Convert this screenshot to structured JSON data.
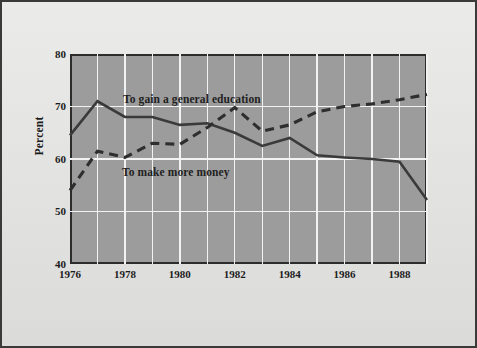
{
  "chart_data": {
    "type": "line",
    "title": "",
    "subtitle": "",
    "xlabel": "",
    "ylabel": "Percent",
    "xlim": [
      1976,
      1989
    ],
    "ylim": [
      40,
      80
    ],
    "yticks": [
      40,
      50,
      60,
      70,
      80
    ],
    "ytick_labels": [
      "40",
      "50",
      "60",
      "70",
      "80"
    ],
    "xticks": [
      1976,
      1978,
      1980,
      1982,
      1984,
      1986,
      1988
    ],
    "xtick_labels": [
      "1976",
      "1978",
      "1980",
      "1982",
      "1984",
      "1986",
      "1988"
    ],
    "grid": true,
    "grid_color": "#f2f2f2",
    "plot_background": "#9c9c9c",
    "figure_background": "#e2e2e0",
    "legend_position": "inline-annotation",
    "x": [
      1976,
      1977,
      1978,
      1979,
      1980,
      1981,
      1982,
      1983,
      1984,
      1985,
      1986,
      1987,
      1988,
      1989
    ],
    "series": [
      {
        "name": "To gain a general education",
        "style": "solid",
        "color": "#3a3a3a",
        "values": [
          64.5,
          71.0,
          68.0,
          68.0,
          66.5,
          66.8,
          65.0,
          62.5,
          64.0,
          60.7,
          60.3,
          60.0,
          59.5,
          52.2
        ]
      },
      {
        "name": "To make more money",
        "style": "dashed",
        "color": "#2e2e2e",
        "values": [
          54.0,
          61.5,
          60.3,
          63.0,
          62.8,
          66.0,
          69.8,
          65.3,
          66.5,
          69.0,
          70.0,
          70.5,
          71.3,
          72.3
        ]
      }
    ],
    "annotations": [
      {
        "text": "To gain a general education",
        "series": "To gain a general education"
      },
      {
        "text": "To make more money",
        "series": "To make more money"
      }
    ]
  }
}
